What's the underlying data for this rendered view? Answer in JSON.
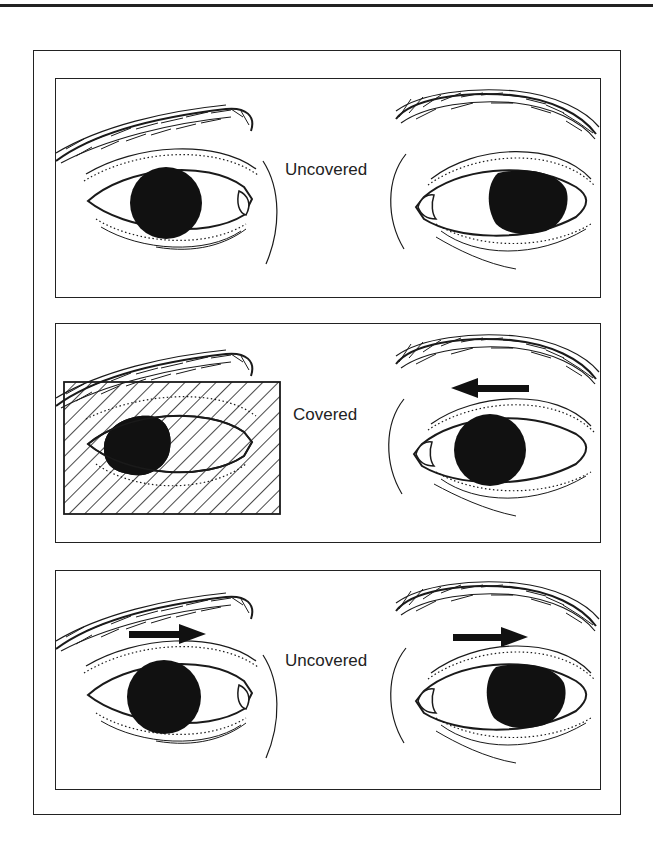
{
  "figure": {
    "panels": [
      {
        "label": "Uncovered",
        "left_eye": {
          "covered": false,
          "pupil_position": "center",
          "arrow": null
        },
        "right_eye": {
          "covered": false,
          "pupil_position": "outward",
          "arrow": null
        }
      },
      {
        "label": "Covered",
        "left_eye": {
          "covered": true,
          "pupil_position": "inward",
          "arrow": null
        },
        "right_eye": {
          "covered": false,
          "pupil_position": "center",
          "arrow": "left"
        }
      },
      {
        "label": "Uncovered",
        "left_eye": {
          "covered": false,
          "pupil_position": "center",
          "arrow": "right"
        },
        "right_eye": {
          "covered": false,
          "pupil_position": "outward",
          "arrow": "right"
        }
      }
    ],
    "colors": {
      "ink": "#1a1a1a",
      "paper": "#ffffff"
    }
  }
}
